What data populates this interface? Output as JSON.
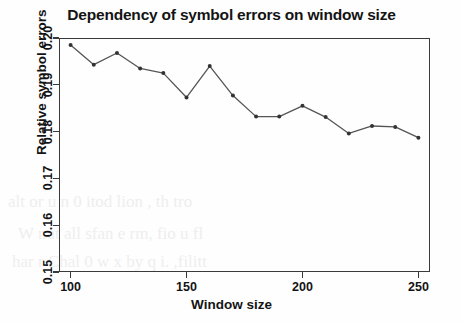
{
  "chart_data": {
    "type": "line",
    "title": "Dependency of symbol errors on window size",
    "xlabel": "Window size",
    "ylabel": "Relative symbol errors",
    "grid": false,
    "legend": null,
    "xlim": [
      95,
      255
    ],
    "ylim": [
      0.15,
      0.2
    ],
    "xticks": [
      "100",
      "150",
      "200",
      "250"
    ],
    "xtick_values": [
      100,
      150,
      200,
      250
    ],
    "yticks": [
      "0.15",
      "0.16",
      "0.17",
      "0.18",
      "0.19",
      "0.20"
    ],
    "ytick_values": [
      0.15,
      0.16,
      0.17,
      0.18,
      0.19,
      0.2
    ],
    "marker": "filled-circle",
    "line_color": "#555555",
    "marker_color": "#333333",
    "x": [
      100,
      110,
      120,
      130,
      140,
      150,
      160,
      170,
      180,
      190,
      200,
      210,
      220,
      230,
      240,
      250
    ],
    "values": [
      0.1985,
      0.1943,
      0.1968,
      0.1935,
      0.1925,
      0.1873,
      0.194,
      0.1877,
      0.1832,
      0.1832,
      0.1855,
      0.1831,
      0.1796,
      0.1812,
      0.181,
      0.1787
    ],
    "series": [
      {
        "name": "Relative symbol errors",
        "values": [
          0.1985,
          0.1943,
          0.1968,
          0.1935,
          0.1925,
          0.1873,
          0.194,
          0.1877,
          0.1832,
          0.1832,
          0.1855,
          0.1831,
          0.1796,
          0.1812,
          0.181,
          0.1787
        ]
      }
    ]
  },
  "artifacts": {
    "bleed_lines": [
      "alt or u  n     0  itod lion ,  th     tro",
      "W nut all   sfan e       rm,  fio u fl",
      "har r Chal 0  w x by q  i. ,filitt"
    ]
  }
}
